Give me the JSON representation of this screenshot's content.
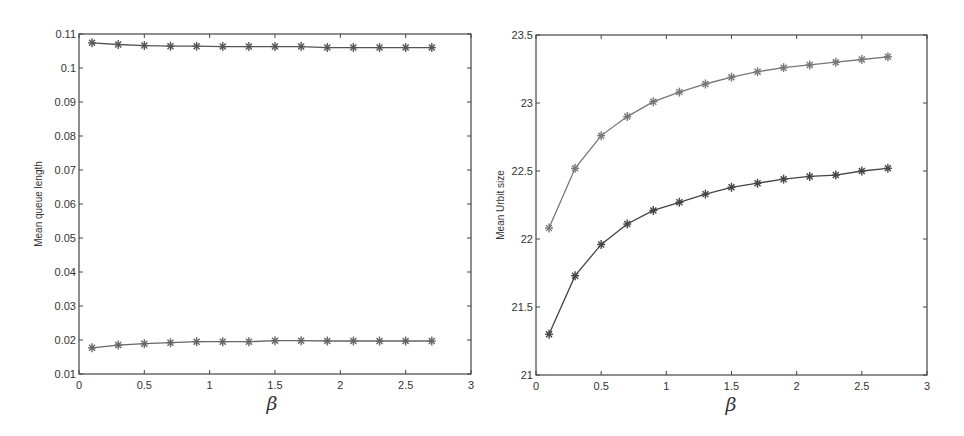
{
  "chart_data": [
    {
      "type": "line",
      "title": "",
      "xlabel": "β",
      "ylabel": "Mean queue length",
      "xlim": [
        0,
        3
      ],
      "ylim": [
        0.01,
        0.11
      ],
      "xticks": [
        "0",
        "0.5",
        "1",
        "1.5",
        "2",
        "2.5",
        "3"
      ],
      "yticks": [
        "0.01",
        "0.02",
        "0.03",
        "0.04",
        "0.05",
        "0.06",
        "0.07",
        "0.08",
        "0.09",
        "0.1",
        "0.11"
      ],
      "grid": false,
      "legend": null,
      "marker": "*",
      "x": [
        0.1,
        0.3,
        0.5,
        0.7,
        0.9,
        1.1,
        1.3,
        1.5,
        1.7,
        1.9,
        2.1,
        2.3,
        2.5,
        2.7
      ],
      "series": [
        {
          "name": "upper",
          "color": "#555555",
          "values": [
            0.1074,
            0.1069,
            0.1066,
            0.1064,
            0.1064,
            0.1063,
            0.1063,
            0.1063,
            0.1063,
            0.106,
            0.106,
            0.106,
            0.106,
            0.106
          ]
        },
        {
          "name": "lower",
          "color": "#666666",
          "values": [
            0.0177,
            0.0185,
            0.0189,
            0.0192,
            0.0195,
            0.0195,
            0.0195,
            0.0198,
            0.0198,
            0.0197,
            0.0197,
            0.0197,
            0.0197,
            0.0197
          ]
        }
      ]
    },
    {
      "type": "line",
      "title": "",
      "xlabel": "β",
      "ylabel": "Mean Urbit size",
      "xlim": [
        0,
        3
      ],
      "ylim": [
        21,
        23.5
      ],
      "xticks": [
        "0",
        "0.5",
        "1",
        "1.5",
        "2",
        "2.5",
        "3"
      ],
      "yticks": [
        "21",
        "21.5",
        "22",
        "22.5",
        "23",
        "23.5"
      ],
      "grid": false,
      "legend": null,
      "marker": "*",
      "x": [
        0.1,
        0.3,
        0.5,
        0.7,
        0.9,
        1.1,
        1.3,
        1.5,
        1.7,
        1.9,
        2.1,
        2.3,
        2.5,
        2.7
      ],
      "series": [
        {
          "name": "upper",
          "color": "#777777",
          "values": [
            22.08,
            22.52,
            22.76,
            22.9,
            23.01,
            23.08,
            23.14,
            23.19,
            23.23,
            23.26,
            23.28,
            23.3,
            23.32,
            23.34
          ]
        },
        {
          "name": "lower",
          "color": "#444444",
          "values": [
            21.3,
            21.73,
            21.96,
            22.11,
            22.21,
            22.27,
            22.33,
            22.38,
            22.41,
            22.44,
            22.46,
            22.47,
            22.5,
            22.52
          ]
        }
      ]
    }
  ],
  "panels": {
    "left": {
      "ylabel": "Mean queue length",
      "xlabel": "β"
    },
    "right": {
      "ylabel": "Mean Urbit size",
      "xlabel": "β"
    }
  }
}
